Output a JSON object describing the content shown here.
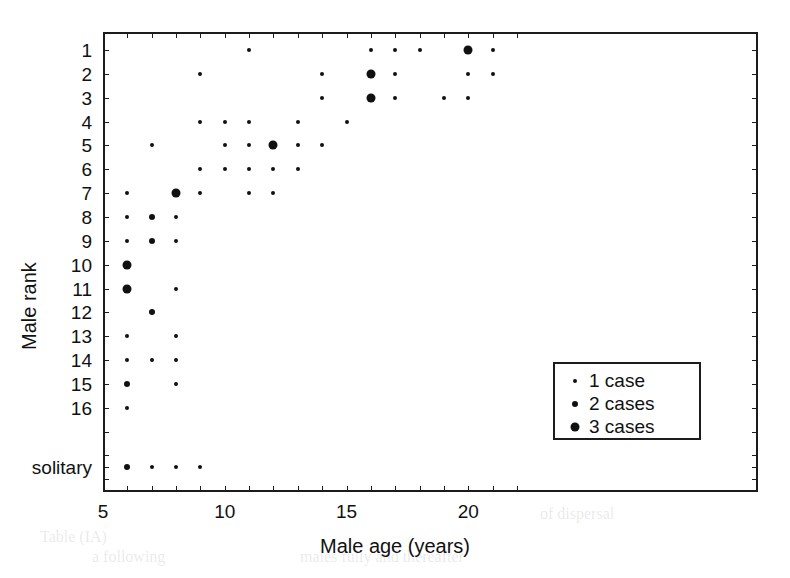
{
  "chart_data": {
    "type": "scatter",
    "title": "",
    "xlabel": "Male age (years)",
    "ylabel": "Male rank",
    "xlim": [
      5,
      22
    ],
    "xticks": [
      5,
      6,
      7,
      8,
      9,
      10,
      11,
      12,
      13,
      14,
      15,
      16,
      17,
      18,
      19,
      20,
      21,
      22
    ],
    "xticklabels": [
      "5",
      "",
      "",
      "",
      "",
      "10",
      "",
      "",
      "",
      "",
      "15",
      "",
      "",
      "",
      "",
      "20",
      "",
      ""
    ],
    "xticklabels_shown": [
      "5",
      "10",
      "15",
      "20"
    ],
    "yticklabels": [
      "1",
      "2",
      "3",
      "4",
      "5",
      "6",
      "7",
      "8",
      "9",
      "10",
      "11",
      "12",
      "13",
      "14",
      "15",
      "16",
      "",
      "",
      "",
      "solitary"
    ],
    "ycategories": [
      1,
      2,
      3,
      4,
      5,
      6,
      7,
      8,
      9,
      10,
      11,
      12,
      13,
      14,
      15,
      16,
      17,
      18,
      19,
      "solitary"
    ],
    "grid": false,
    "size_encoding": {
      "1": "small",
      "2": "medium",
      "3": "large"
    },
    "legend": {
      "position": "lower-right-inside",
      "entries": [
        {
          "marker": "small",
          "label": "1 case",
          "cases": 1
        },
        {
          "marker": "medium",
          "label": "2 cases",
          "cases": 2
        },
        {
          "marker": "large",
          "label": "3 cases",
          "cases": 3
        }
      ]
    },
    "points": [
      {
        "age": 11,
        "rank": 1,
        "cases": 1
      },
      {
        "age": 16,
        "rank": 1,
        "cases": 1
      },
      {
        "age": 17,
        "rank": 1,
        "cases": 1
      },
      {
        "age": 18,
        "rank": 1,
        "cases": 1
      },
      {
        "age": 20,
        "rank": 1,
        "cases": 3
      },
      {
        "age": 21,
        "rank": 1,
        "cases": 1
      },
      {
        "age": 9,
        "rank": 2,
        "cases": 1
      },
      {
        "age": 14,
        "rank": 2,
        "cases": 1
      },
      {
        "age": 16,
        "rank": 2,
        "cases": 3
      },
      {
        "age": 17,
        "rank": 2,
        "cases": 1
      },
      {
        "age": 20,
        "rank": 2,
        "cases": 1
      },
      {
        "age": 21,
        "rank": 2,
        "cases": 1
      },
      {
        "age": 14,
        "rank": 3,
        "cases": 1
      },
      {
        "age": 16,
        "rank": 3,
        "cases": 3
      },
      {
        "age": 17,
        "rank": 3,
        "cases": 1
      },
      {
        "age": 19,
        "rank": 3,
        "cases": 1
      },
      {
        "age": 20,
        "rank": 3,
        "cases": 1
      },
      {
        "age": 9,
        "rank": 4,
        "cases": 1
      },
      {
        "age": 10,
        "rank": 4,
        "cases": 1
      },
      {
        "age": 11,
        "rank": 4,
        "cases": 1
      },
      {
        "age": 13,
        "rank": 4,
        "cases": 1
      },
      {
        "age": 15,
        "rank": 4,
        "cases": 1
      },
      {
        "age": 7,
        "rank": 5,
        "cases": 1
      },
      {
        "age": 10,
        "rank": 5,
        "cases": 1
      },
      {
        "age": 11,
        "rank": 5,
        "cases": 1
      },
      {
        "age": 12,
        "rank": 5,
        "cases": 3
      },
      {
        "age": 13,
        "rank": 5,
        "cases": 1
      },
      {
        "age": 14,
        "rank": 5,
        "cases": 1
      },
      {
        "age": 9,
        "rank": 6,
        "cases": 1
      },
      {
        "age": 10,
        "rank": 6,
        "cases": 1
      },
      {
        "age": 11,
        "rank": 6,
        "cases": 1
      },
      {
        "age": 12,
        "rank": 6,
        "cases": 1
      },
      {
        "age": 13,
        "rank": 6,
        "cases": 1
      },
      {
        "age": 6,
        "rank": 7,
        "cases": 1
      },
      {
        "age": 8,
        "rank": 7,
        "cases": 3
      },
      {
        "age": 9,
        "rank": 7,
        "cases": 1
      },
      {
        "age": 11,
        "rank": 7,
        "cases": 1
      },
      {
        "age": 12,
        "rank": 7,
        "cases": 1
      },
      {
        "age": 6,
        "rank": 8,
        "cases": 1
      },
      {
        "age": 7,
        "rank": 8,
        "cases": 2
      },
      {
        "age": 8,
        "rank": 8,
        "cases": 1
      },
      {
        "age": 6,
        "rank": 9,
        "cases": 1
      },
      {
        "age": 7,
        "rank": 9,
        "cases": 2
      },
      {
        "age": 8,
        "rank": 9,
        "cases": 1
      },
      {
        "age": 6,
        "rank": 10,
        "cases": 3
      },
      {
        "age": 6,
        "rank": 11,
        "cases": 3
      },
      {
        "age": 8,
        "rank": 11,
        "cases": 1
      },
      {
        "age": 7,
        "rank": 12,
        "cases": 2
      },
      {
        "age": 6,
        "rank": 13,
        "cases": 1
      },
      {
        "age": 8,
        "rank": 13,
        "cases": 1
      },
      {
        "age": 6,
        "rank": 14,
        "cases": 1
      },
      {
        "age": 7,
        "rank": 14,
        "cases": 1
      },
      {
        "age": 8,
        "rank": 14,
        "cases": 1
      },
      {
        "age": 6,
        "rank": 15,
        "cases": 2
      },
      {
        "age": 8,
        "rank": 15,
        "cases": 1
      },
      {
        "age": 6,
        "rank": 16,
        "cases": 1
      },
      {
        "age": 6,
        "rank": "solitary",
        "cases": 2
      },
      {
        "age": 7,
        "rank": "solitary",
        "cases": 1
      },
      {
        "age": 8,
        "rank": "solitary",
        "cases": 1
      },
      {
        "age": 9,
        "rank": "solitary",
        "cases": 1
      }
    ]
  },
  "colors": {
    "marker": "#111111",
    "axis": "#1c1c1c",
    "background": "#ffffff"
  },
  "background_text": [
    {
      "text": "of dispersal",
      "x": 540,
      "y": 505
    },
    {
      "text": "a following",
      "x": 92,
      "y": 548
    },
    {
      "text": "males fully and thereafter",
      "x": 300,
      "y": 548
    },
    {
      "text": "Table (IA)",
      "x": 40,
      "y": 528
    }
  ]
}
